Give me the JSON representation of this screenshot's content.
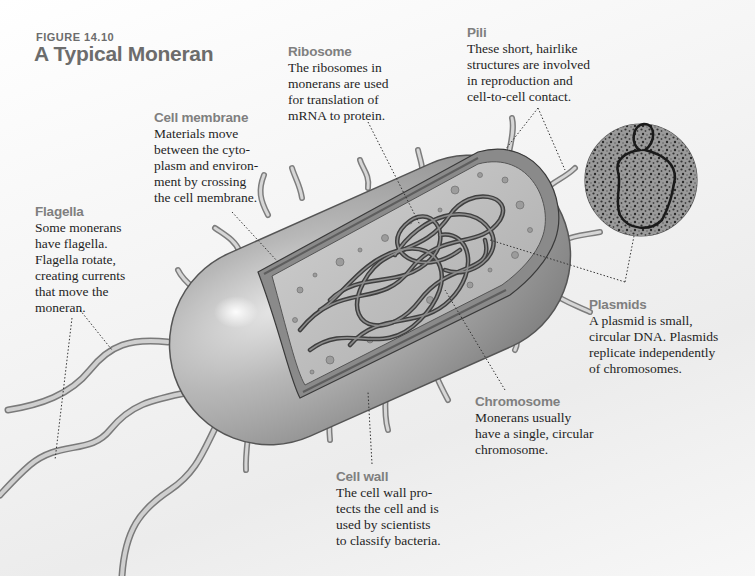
{
  "figure": {
    "label": "FIGURE 14.10",
    "title": "A Typical Moneran"
  },
  "callouts": {
    "ribosome": {
      "heading": "Ribosome",
      "body": "The ribosomes in\nmonerans are used\nfor translation of\nmRNA to protein."
    },
    "pili": {
      "heading": "Pili",
      "body": "These short, hairlike\nstructures are involved\nin reproduction and\ncell-to-cell contact."
    },
    "cell_membrane": {
      "heading": "Cell membrane",
      "body": "Materials move\nbetween the cyto-\nplasm and environ-\nment by crossing\nthe cell membrane."
    },
    "flagella": {
      "heading": "Flagella",
      "body": "Some monerans\nhave flagella.\nFlagella rotate,\ncreating currents\nthat move the\nmoneran."
    },
    "plasmids": {
      "heading": "Plasmids",
      "body": "A plasmid is small,\ncircular DNA. Plasmids\nreplicate independently\nof chromosomes."
    },
    "chromosome": {
      "heading": "Chromosome",
      "body": "Monerans usually\nhave a single, circular\nchromosome."
    },
    "cell_wall": {
      "heading": "Cell wall",
      "body": "The cell wall pro-\ntects the cell and is\nused by scientists\nto classify bacteria."
    }
  },
  "illustration": {
    "subject": "moneran-cell-cutaway",
    "inset": "plasmid-micrograph",
    "colors": {
      "cell_body": "#a9a9a9",
      "cell_highlight": "#e6e6e6",
      "cytoplasm": "#c8c8c8",
      "chromosome": "#5a5a5a",
      "heading_gray": "#7f7f7f",
      "leader_line": "#333333"
    }
  }
}
